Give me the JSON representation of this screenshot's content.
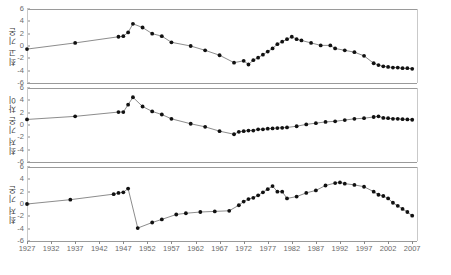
{
  "chart_data": {
    "type": "line",
    "title": "",
    "subtitle": "",
    "xlabel": "",
    "xlim": [
      1927,
      2008
    ],
    "ylim": [
      -6,
      6
    ],
    "grid": false,
    "legend": null,
    "xticks": [
      1927,
      1932,
      1937,
      1942,
      1947,
      1952,
      1957,
      1962,
      1967,
      1972,
      1977,
      1982,
      1987,
      1992,
      1997,
      2002,
      2007
    ],
    "yticks": [
      6,
      4,
      2,
      0,
      -2,
      -4,
      -6
    ],
    "marker_color": "#111111",
    "line_color": "#6e6e6e",
    "panels": [
      {
        "ylabel": "최고 기온",
        "ylim": [
          -6,
          6
        ],
        "yticks": [
          6,
          4,
          2,
          0,
          -2,
          -4,
          -6
        ],
        "x": [
          1927,
          1937,
          1946,
          1947,
          1948,
          1949,
          1951,
          1953,
          1955,
          1957,
          1961,
          1964,
          1967,
          1970,
          1972,
          1973,
          1974,
          1975,
          1976,
          1977,
          1978,
          1979,
          1980,
          1981,
          1982,
          1983,
          1984,
          1986,
          1988,
          1990,
          1991,
          1993,
          1995,
          1997,
          1999,
          2000,
          2001,
          2002,
          2003,
          2004,
          2005,
          2006,
          2007
        ],
        "y": [
          -0.5,
          0.5,
          1.5,
          1.6,
          2.2,
          3.6,
          3.0,
          2.0,
          1.6,
          0.6,
          0.0,
          -0.7,
          -1.5,
          -2.7,
          -2.4,
          -3.0,
          -2.3,
          -1.9,
          -1.4,
          -0.9,
          -0.4,
          0.3,
          0.7,
          1.1,
          1.5,
          1.1,
          0.9,
          0.5,
          0.1,
          0.1,
          -0.4,
          -0.7,
          -1.0,
          -1.6,
          -2.8,
          -3.1,
          -3.3,
          -3.4,
          -3.5,
          -3.5,
          -3.6,
          -3.6,
          -3.7
        ]
      },
      {
        "ylabel": "최저 기온 차이",
        "ylim": [
          -6,
          6
        ],
        "yticks": [
          6,
          4,
          2,
          0,
          -2,
          -4,
          -6
        ],
        "x": [
          1927,
          1937,
          1946,
          1947,
          1948,
          1949,
          1951,
          1953,
          1955,
          1957,
          1961,
          1964,
          1967,
          1970,
          1971,
          1972,
          1973,
          1974,
          1975,
          1976,
          1977,
          1978,
          1979,
          1980,
          1981,
          1983,
          1985,
          1987,
          1989,
          1991,
          1993,
          1995,
          1997,
          1999,
          2000,
          2001,
          2002,
          2003,
          2004,
          2005,
          2006,
          2007
        ],
        "y": [
          0.9,
          1.4,
          2.1,
          2.1,
          3.3,
          4.5,
          3.0,
          2.2,
          1.7,
          1.0,
          0.2,
          -0.3,
          -1.0,
          -1.5,
          -1.1,
          -1.0,
          -0.9,
          -0.9,
          -0.7,
          -0.7,
          -0.6,
          -0.55,
          -0.5,
          -0.45,
          -0.4,
          -0.2,
          0.1,
          0.3,
          0.5,
          0.6,
          0.8,
          1.0,
          1.1,
          1.3,
          1.4,
          1.15,
          1.1,
          1.0,
          1.0,
          0.95,
          0.9,
          0.85
        ]
      },
      {
        "ylabel": "최저 기온",
        "ylim": [
          -6,
          6
        ],
        "yticks": [
          6,
          4,
          2,
          0,
          -2,
          -4,
          -6
        ],
        "x": [
          1927,
          1936,
          1945,
          1946,
          1947,
          1948,
          1950,
          1953,
          1955,
          1958,
          1960,
          1963,
          1966,
          1969,
          1971,
          1972,
          1973,
          1974,
          1975,
          1976,
          1977,
          1978,
          1979,
          1980,
          1981,
          1983,
          1985,
          1987,
          1989,
          1991,
          1992,
          1993,
          1995,
          1997,
          1999,
          2000,
          2001,
          2002,
          2003,
          2004,
          2005,
          2006,
          2007
        ],
        "y": [
          0.0,
          0.7,
          1.6,
          1.8,
          1.9,
          2.5,
          -3.9,
          -3.0,
          -2.5,
          -1.7,
          -1.5,
          -1.3,
          -1.2,
          -1.1,
          -0.2,
          0.4,
          0.8,
          1.0,
          1.4,
          1.9,
          2.4,
          2.9,
          2.0,
          2.0,
          0.9,
          1.2,
          1.8,
          2.2,
          3.0,
          3.4,
          3.5,
          3.3,
          3.1,
          2.8,
          2.0,
          1.5,
          1.3,
          0.9,
          0.2,
          -0.3,
          -0.8,
          -1.3,
          -1.9
        ]
      }
    ]
  }
}
